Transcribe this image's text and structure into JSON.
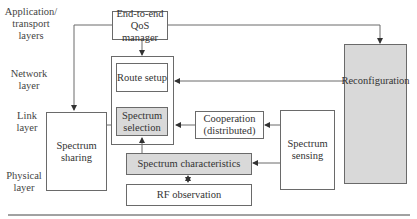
{
  "layers": {
    "application": "Application/ transport layers",
    "network": "Network layer",
    "link": "Link layer",
    "physical": "Physical layer"
  },
  "boxes": {
    "qos_manager": "End-to-end QoS manager",
    "route_setup": "Route setup",
    "spectrum_selection": "Spectrum selection",
    "cooperation": "Cooperation (distributed)",
    "spectrum_sensing": "Spectrum sensing",
    "reconfiguration": "Reconfiguration",
    "spectrum_sharing": "Spectrum sharing",
    "spectrum_characteristics": "Spectrum characteristics",
    "rf_observation": "RF observation"
  },
  "colors": {
    "shaded": "#d9d9d9",
    "line": "#6a6a6a"
  }
}
